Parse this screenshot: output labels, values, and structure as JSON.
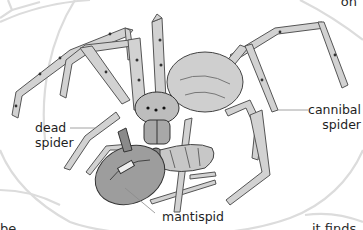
{
  "illustration": {
    "subject": "cannibal spider eating dead spider with mantispid",
    "labels": {
      "dead_spider_line1": "dead",
      "dead_spider_line2": "spider",
      "cannibal_spider_line1": "cannibal",
      "cannibal_spider_line2": "spider",
      "mantispid": "mantispid"
    }
  },
  "text_fragments": {
    "top_right": "on",
    "bottom_left": "be",
    "bottom_right": "it finds"
  },
  "colors": {
    "background": "#ffffff",
    "web_lines": "#d9d9d9",
    "ink": "#2b2b2b",
    "leg_fill": "#c9c9c9",
    "leader_line": "#8a8a8a"
  }
}
